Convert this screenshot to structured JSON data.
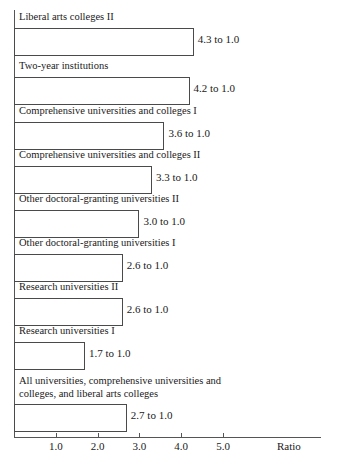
{
  "chart_data": {
    "type": "bar",
    "orientation": "horizontal",
    "title": "",
    "xlabel": "Ratio",
    "ylabel": "",
    "xlim": [
      0,
      5.6
    ],
    "grid": false,
    "legend": null,
    "tick_labels": [
      "1.0",
      "2.0",
      "3.0",
      "4.0",
      "5.0"
    ],
    "tick_values": [
      1.0,
      2.0,
      3.0,
      4.0,
      5.0
    ],
    "categories": [
      "Liberal arts colleges II",
      "Two-year institutions",
      "Comprehensive universities and colleges I",
      "Comprehensive universities and colleges II",
      "Other doctoral-granting universities II",
      "Other doctoral-granting universities I",
      "Research universities II",
      "Research universities I",
      "All universities, comprehensive universities and colleges, and liberal arts colleges"
    ],
    "values": [
      4.3,
      4.2,
      3.6,
      3.3,
      3.0,
      2.6,
      2.6,
      1.7,
      2.7
    ],
    "value_labels": [
      "4.3 to 1.0",
      "4.2 to 1.0",
      "3.6 to 1.0",
      "3.3 to 1.0",
      "3.0 to 1.0",
      "2.6 to 1.0",
      "2.6 to 1.0",
      "1.7 to 1.0",
      "2.7 to 1.0"
    ],
    "bar_color": "#ffffff",
    "bar_border_color": "#4a4a4a",
    "axis_color": "#555555"
  },
  "bars": [
    {
      "label": "Liberal arts colleges II",
      "value_label": "4.3 to 1.0",
      "value": 4.3,
      "label_top": 11,
      "bar_top": 28,
      "bar_height": 28,
      "two_line": false
    },
    {
      "label": "Two-year institutions",
      "value_label": "4.2 to 1.0",
      "value": 4.2,
      "label_top": 60,
      "bar_top": 77,
      "bar_height": 28,
      "two_line": false
    },
    {
      "label": "Comprehensive universities and colleges I",
      "value_label": "3.6 to 1.0",
      "value": 3.6,
      "label_top": 105,
      "bar_top": 122,
      "bar_height": 28,
      "two_line": false
    },
    {
      "label": "Comprehensive universities and colleges II",
      "value_label": "3.3 to 1.0",
      "value": 3.3,
      "label_top": 149,
      "bar_top": 166,
      "bar_height": 28,
      "two_line": false
    },
    {
      "label": "Other doctoral-granting universities II",
      "value_label": "3.0 to 1.0",
      "value": 3.0,
      "label_top": 193,
      "bar_top": 210,
      "bar_height": 28,
      "two_line": false
    },
    {
      "label": "Other doctoral-granting universities I",
      "value_label": "2.6 to 1.0",
      "value": 2.6,
      "label_top": 237,
      "bar_top": 254,
      "bar_height": 28,
      "two_line": false
    },
    {
      "label": "Research universities II",
      "value_label": "2.6 to 1.0",
      "value": 2.6,
      "label_top": 281,
      "bar_top": 298,
      "bar_height": 28,
      "two_line": false
    },
    {
      "label": "Research universities I",
      "value_label": "1.7 to 1.0",
      "value": 1.7,
      "label_top": 325,
      "bar_top": 342,
      "bar_height": 28,
      "two_line": false
    },
    {
      "label": "All universities, comprehensive universities and colleges, and liberal arts colleges",
      "value_label": "2.7 to 1.0",
      "value": 2.7,
      "label_top": 375,
      "bar_top": 404,
      "bar_height": 28,
      "two_line": true
    }
  ],
  "axis": {
    "ratio_label": "Ratio"
  }
}
